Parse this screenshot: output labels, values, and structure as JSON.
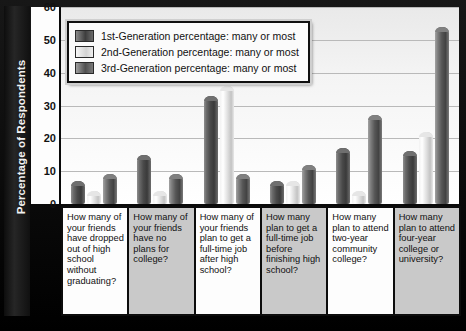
{
  "chart_data": {
    "type": "bar",
    "title": "",
    "xlabel": "",
    "ylabel": "Percentage of Respondents",
    "ylim": [
      0,
      60
    ],
    "yticks": [
      0,
      10,
      20,
      30,
      40,
      50,
      60
    ],
    "grid": true,
    "legend_position": "top-left",
    "categories": [
      "How many of your friends have dropped out of high school without graduating?",
      "How many of your friends have no plans for college?",
      "How many of your friends plan to get a full-time job after high school?",
      "How many plan to get a full-time job before finishing high school?",
      "How many plan to attend two-year community college?",
      "How many plan to attend four-year college or university?"
    ],
    "series": [
      {
        "name": "1st-Generation percentage: many or most",
        "color": "#4a4a4a",
        "values": [
          7,
          15,
          33,
          7,
          17,
          16
        ]
      },
      {
        "name": "2nd-Generation percentage: many or most",
        "color": "#e0e0e0",
        "values": [
          4,
          4,
          36,
          7,
          4,
          22
        ]
      },
      {
        "name": "3rd-Generation percentage: many or most",
        "color": "#6e6e6e",
        "values": [
          9,
          9,
          9,
          12,
          27,
          54
        ]
      }
    ]
  },
  "axis": {
    "y_title": "Percentage of Respondents",
    "tick_labels": [
      "60",
      "50",
      "40",
      "30",
      "20",
      "10",
      "0"
    ]
  },
  "legend": {
    "items": [
      {
        "label": "1st-Generation percentage: many or most",
        "swatch": "dark-gray"
      },
      {
        "label": "2nd-Generation percentage: many or most",
        "swatch": "white"
      },
      {
        "label": "3rd-Generation percentage: many or most",
        "swatch": "medium-gray"
      }
    ]
  }
}
